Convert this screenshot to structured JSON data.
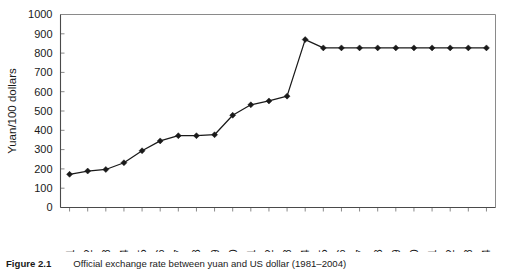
{
  "caption": {
    "label": "Figure 2.1",
    "text": "Official exchange rate between yuan and US dollar (1981–2004)"
  },
  "chart_data": {
    "type": "line",
    "title": "",
    "xlabel": "",
    "ylabel": "Yuan/100 dollars",
    "ylim": [
      0,
      1000
    ],
    "ytick_step": 100,
    "yticks": [
      "0",
      "100",
      "200",
      "300",
      "400",
      "500",
      "600",
      "700",
      "800",
      "900",
      "1000"
    ],
    "grid": false,
    "legend": "none",
    "marker": "diamond",
    "line_color": "#1a1a1a",
    "categories": [
      "1981",
      "1982",
      "1983",
      "1984",
      "1985",
      "1986",
      "1987",
      "1988",
      "1989",
      "1990",
      "1991",
      "1992",
      "1993",
      "1994",
      "1995",
      "1996",
      "1997",
      "1998",
      "1999",
      "2000",
      "2001",
      "2002",
      "2003",
      "2004"
    ],
    "values": [
      172,
      189,
      197,
      232,
      294,
      345,
      372,
      372,
      377,
      478,
      532,
      552,
      577,
      870,
      827,
      827,
      827,
      827,
      827,
      827,
      827,
      827,
      827,
      827
    ]
  }
}
